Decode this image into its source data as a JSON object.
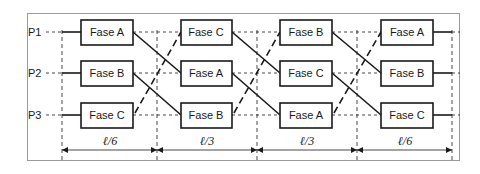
{
  "diagram": {
    "rows": [
      {
        "label": "P1",
        "phases": [
          "Fase A",
          "Fase C",
          "Fase B",
          "Fase A"
        ]
      },
      {
        "label": "P2",
        "phases": [
          "Fase B",
          "Fase A",
          "Fase C",
          "Fase B"
        ]
      },
      {
        "label": "P3",
        "phases": [
          "Fase C",
          "Fase B",
          "Fase A",
          "Fase C"
        ]
      }
    ],
    "segments": [
      "ℓ/6",
      "ℓ/3",
      "ℓ/3",
      "ℓ/6"
    ],
    "colors": {
      "line": "#1a1a1a",
      "frame": "#9a9a9a",
      "background": "#ffffff"
    }
  }
}
